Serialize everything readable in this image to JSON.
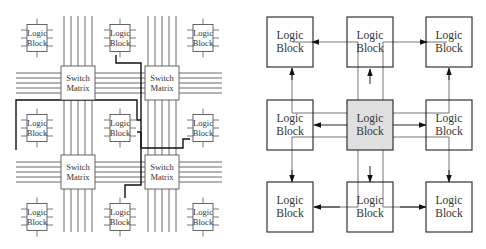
{
  "left_diagram": {
    "title": "Island-style FPGA routing fabric",
    "logic_block_label": [
      "Logic",
      "Block"
    ],
    "switch_matrix_label": [
      "Switch",
      "Matrix"
    ],
    "logic_blocks": [
      {
        "row": 0,
        "col": 0
      },
      {
        "row": 0,
        "col": 1
      },
      {
        "row": 0,
        "col": 2
      },
      {
        "row": 1,
        "col": 0
      },
      {
        "row": 1,
        "col": 1
      },
      {
        "row": 1,
        "col": 2
      },
      {
        "row": 2,
        "col": 0
      },
      {
        "row": 2,
        "col": 1
      },
      {
        "row": 2,
        "col": 2
      }
    ],
    "switch_matrices": [
      {
        "row": 0,
        "col": 0
      },
      {
        "row": 0,
        "col": 1
      },
      {
        "row": 1,
        "col": 0
      },
      {
        "row": 1,
        "col": 1
      }
    ],
    "wires_per_channel": 5
  },
  "right_diagram": {
    "title": "Nearest-neighbour logic block interconnect",
    "logic_block_label": [
      "Logic",
      "Block"
    ],
    "center_fill": "#e0e0e0",
    "grid": [
      {
        "row": 0,
        "col": 0,
        "highlight": false
      },
      {
        "row": 0,
        "col": 1,
        "highlight": false
      },
      {
        "row": 0,
        "col": 2,
        "highlight": false
      },
      {
        "row": 1,
        "col": 0,
        "highlight": false
      },
      {
        "row": 1,
        "col": 1,
        "highlight": true
      },
      {
        "row": 1,
        "col": 2,
        "highlight": false
      },
      {
        "row": 2,
        "col": 0,
        "highlight": false
      },
      {
        "row": 2,
        "col": 1,
        "highlight": false
      },
      {
        "row": 2,
        "col": 2,
        "highlight": false
      }
    ],
    "arrows_from_center_to": [
      "top-left",
      "top",
      "top-right",
      "left",
      "right",
      "bottom-left",
      "bottom",
      "bottom-right"
    ]
  }
}
